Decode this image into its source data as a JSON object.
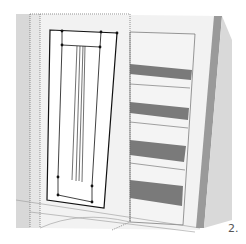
{
  "figure": {
    "step_label": "2.",
    "colors": {
      "background": "#ffffff",
      "frame_light": "#f2f2f2",
      "frame_side": "#cfcfcf",
      "frame_dark_edge": "#9a9a9a",
      "shelf_dark": "#7a7a7a",
      "shelf_light": "#ececec",
      "door_face": "#ffffff",
      "line": "#1a1a1a",
      "dotted_line": "#666666"
    }
  }
}
